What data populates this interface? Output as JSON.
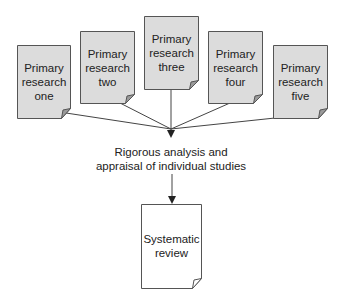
{
  "diagram": {
    "sources": [
      {
        "id": "one",
        "lines": [
          "Primary",
          "research",
          "one"
        ]
      },
      {
        "id": "two",
        "lines": [
          "Primary",
          "research",
          "two"
        ]
      },
      {
        "id": "three",
        "lines": [
          "Primary",
          "research",
          "three"
        ]
      },
      {
        "id": "four",
        "lines": [
          "Primary",
          "research",
          "four"
        ]
      },
      {
        "id": "five",
        "lines": [
          "Primary",
          "research",
          "five"
        ]
      }
    ],
    "process": {
      "line1": "Rigorous analysis and",
      "line2": "appraisal of individual studies"
    },
    "output": {
      "lines": [
        "Systematic",
        "review"
      ]
    },
    "colors": {
      "source_fill": "#dcdcdc",
      "output_fill": "#ffffff",
      "stroke": "#555555",
      "text": "#222222"
    }
  }
}
